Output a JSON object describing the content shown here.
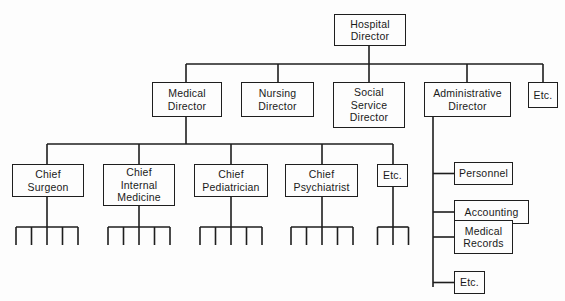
{
  "diagram": {
    "type": "organization-chart",
    "line_color": "#1e1e1e",
    "root": {
      "id": "hospital-director",
      "lines": [
        "Hospital",
        "Director"
      ],
      "box": [
        334,
        14,
        72,
        32
      ]
    },
    "level1_bus": {
      "y": 64,
      "x1": 186,
      "x2": 543,
      "root_x": 369
    },
    "level1": [
      {
        "id": "medical-director",
        "lines": [
          "Medical",
          "Director"
        ],
        "box": [
          152,
          82,
          70,
          35
        ],
        "cx": 186
      },
      {
        "id": "nursing-director",
        "lines": [
          "Nursing",
          "Director"
        ],
        "box": [
          241,
          82,
          73,
          35
        ],
        "cx": 278
      },
      {
        "id": "social-service-director",
        "lines": [
          "Social",
          "Service",
          "Director"
        ],
        "box": [
          333,
          82,
          72,
          46
        ],
        "cx": 369
      },
      {
        "id": "administrative-director",
        "lines": [
          "Administrative",
          "Director"
        ],
        "box": [
          424,
          82,
          87,
          35
        ],
        "cx": 467
      },
      {
        "id": "etc-top",
        "lines": [
          "Etc."
        ],
        "box": [
          528,
          82,
          30,
          26
        ],
        "cx": 543
      }
    ],
    "medical_bus": {
      "y": 144,
      "x1": 47,
      "x2": 393,
      "parent_x": 186,
      "parent_bottom": 117
    },
    "chiefs": [
      {
        "id": "chief-surgeon",
        "lines": [
          "Chief",
          "Surgeon"
        ],
        "box": [
          12,
          164,
          72,
          33
        ],
        "cx": 47,
        "sub_count": 5,
        "sub_width": 62
      },
      {
        "id": "chief-internal-medicine",
        "lines": [
          "Chief",
          "Internal",
          "Medicine"
        ],
        "box": [
          103,
          164,
          72,
          42
        ],
        "cx": 139,
        "sub_count": 5,
        "sub_width": 62
      },
      {
        "id": "chief-pediatrician",
        "lines": [
          "Chief",
          "Pediatrician"
        ],
        "box": [
          194,
          164,
          74,
          33
        ],
        "cx": 231,
        "sub_count": 5,
        "sub_width": 62
      },
      {
        "id": "chief-psychiatrist",
        "lines": [
          "Chief",
          "Psychiatrist"
        ],
        "box": [
          285,
          164,
          73,
          33
        ],
        "cx": 322,
        "sub_count": 5,
        "sub_width": 62
      },
      {
        "id": "etc-chief",
        "lines": [
          "Etc."
        ],
        "box": [
          377,
          164,
          31,
          23
        ],
        "cx": 393,
        "sub_count": 3,
        "sub_width": 31
      }
    ],
    "sub_bus": {
      "y": 227,
      "bottom": 245
    },
    "admin_spine": {
      "x": 433,
      "top": 117,
      "bottom": 287
    },
    "admin_units": [
      {
        "id": "personnel",
        "lines": [
          "Personnel"
        ],
        "box": [
          454,
          162,
          59,
          23
        ],
        "cy": 173
      },
      {
        "id": "accounting",
        "lines": [
          "Accounting"
        ],
        "box": [
          454,
          200,
          75,
          24
        ],
        "cy": 191
      },
      {
        "id": "medical-records",
        "lines": [
          "Medical",
          "Records"
        ],
        "box": [
          454,
          220,
          59,
          34
        ],
        "cy": 237
      },
      {
        "id": "etc-admin",
        "lines": [
          "Etc."
        ],
        "box": [
          454,
          271,
          31,
          23
        ],
        "cy": 282
      }
    ]
  }
}
